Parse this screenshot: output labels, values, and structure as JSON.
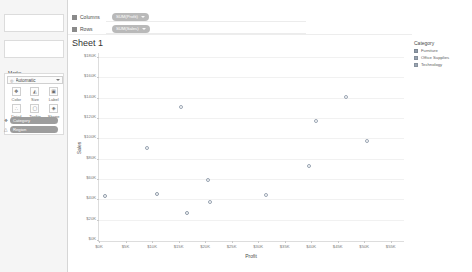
{
  "sidebar": {
    "pages_label": "Pages",
    "filters_label": "Filters",
    "marks_label": "Marks",
    "mark_type": {
      "icon": "marks-type-icon",
      "value": "Automatic"
    },
    "properties": [
      {
        "name": "color",
        "label": "Color",
        "glyph": "❖"
      },
      {
        "name": "size",
        "label": "Size",
        "glyph": "◭"
      },
      {
        "name": "label",
        "label": "Label",
        "glyph": "▣"
      },
      {
        "name": "detail",
        "label": "Detail",
        "glyph": "∴"
      },
      {
        "name": "tooltip",
        "label": "Tooltip",
        "glyph": "▢"
      },
      {
        "name": "shape",
        "label": "Shape",
        "glyph": "◈"
      }
    ],
    "marks_pills": [
      {
        "name": "color-pill",
        "glyph": "❖",
        "label": "Category"
      },
      {
        "name": "shape-pill",
        "glyph": "△",
        "label": "Region"
      }
    ]
  },
  "shelves": {
    "columns_label": "Columns",
    "rows_label": "Rows",
    "columns_pill": "SUM(Profit)",
    "rows_pill": "SUM(Sales)"
  },
  "sheet": {
    "title": "Sheet 1"
  },
  "legend": {
    "title": "Category",
    "items": [
      {
        "label": "Furniture",
        "color": "#8f9aa8"
      },
      {
        "label": "Office Supplies",
        "color": "#97a2b0"
      },
      {
        "label": "Technology",
        "color": "#9aa5b3"
      }
    ]
  },
  "chart_data": {
    "type": "scatter",
    "title": "Sheet 1",
    "xlabel": "Profit",
    "ylabel": "Sales",
    "xlim": [
      0,
      57500
    ],
    "ylim": [
      0,
      185000
    ],
    "grid": true,
    "legend_position": "right",
    "xticks": [
      "$0K",
      "$5K",
      "$10K",
      "$15K",
      "$20K",
      "$25K",
      "$30K",
      "$35K",
      "$40K",
      "$45K",
      "$50K",
      "$55K"
    ],
    "xtick_values": [
      0,
      5000,
      10000,
      15000,
      20000,
      25000,
      30000,
      35000,
      40000,
      45000,
      50000,
      55000
    ],
    "yticks": [
      "$180K",
      "$160K",
      "$140K",
      "$120K",
      "$100K",
      "$80K",
      "$60K",
      "$40K",
      "$20K",
      "$0K"
    ],
    "ytick_values": [
      180000,
      160000,
      140000,
      120000,
      100000,
      80000,
      60000,
      40000,
      20000,
      0
    ],
    "points": [
      {
        "x": 1200,
        "y": 44000,
        "category": "Furniture"
      },
      {
        "x": 9000,
        "y": 92000,
        "category": "Office Supplies"
      },
      {
        "x": 11000,
        "y": 46000,
        "category": "Furniture"
      },
      {
        "x": 15500,
        "y": 132000,
        "category": "Technology"
      },
      {
        "x": 16500,
        "y": 28000,
        "category": "Furniture"
      },
      {
        "x": 20500,
        "y": 60000,
        "category": "Office Supplies"
      },
      {
        "x": 21000,
        "y": 38000,
        "category": "Office Supplies"
      },
      {
        "x": 31500,
        "y": 45000,
        "category": "Technology"
      },
      {
        "x": 39500,
        "y": 74000,
        "category": "Office Supplies"
      },
      {
        "x": 41000,
        "y": 118000,
        "category": "Technology"
      },
      {
        "x": 46500,
        "y": 142000,
        "category": "Technology"
      },
      {
        "x": 50500,
        "y": 98000,
        "category": "Technology"
      }
    ]
  }
}
